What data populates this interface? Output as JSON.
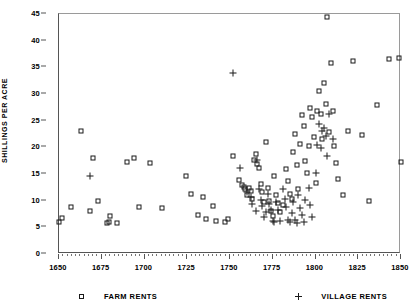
{
  "chart_data": {
    "type": "scatter",
    "title": "",
    "xlabel": "",
    "ylabel": "SHILLINGS PER ACRE",
    "xlim": [
      1650,
      1850
    ],
    "ylim": [
      0,
      45
    ],
    "xticks": [
      1650,
      1675,
      1700,
      1725,
      1750,
      1775,
      1800,
      1825,
      1850
    ],
    "yticks": [
      0,
      5,
      10,
      15,
      20,
      25,
      30,
      35,
      40,
      45
    ],
    "grid": false,
    "legend_position": "below-axes",
    "series": [
      {
        "name": "FARM RENTS",
        "marker": "square",
        "points": [
          [
            1650,
            6.0
          ],
          [
            1652,
            6.7
          ],
          [
            1657,
            8.8
          ],
          [
            1663,
            23.0
          ],
          [
            1668,
            8.1
          ],
          [
            1670,
            18.0
          ],
          [
            1673,
            9.9
          ],
          [
            1678,
            5.9
          ],
          [
            1679,
            6.0
          ],
          [
            1680,
            7.2
          ],
          [
            1684,
            5.8
          ],
          [
            1690,
            17.2
          ],
          [
            1694,
            18.0
          ],
          [
            1697,
            8.9
          ],
          [
            1703,
            17.0
          ],
          [
            1710,
            8.7
          ],
          [
            1724,
            14.6
          ],
          [
            1727,
            11.2
          ],
          [
            1731,
            7.3
          ],
          [
            1734,
            10.7
          ],
          [
            1736,
            6.5
          ],
          [
            1740,
            9.0
          ],
          [
            1742,
            6.2
          ],
          [
            1747,
            6.0
          ],
          [
            1749,
            6.6
          ],
          [
            1752,
            18.3
          ],
          [
            1755,
            13.8
          ],
          [
            1757,
            12.9
          ],
          [
            1758,
            12.6
          ],
          [
            1759,
            12.2
          ],
          [
            1760,
            11.1
          ],
          [
            1761,
            12.4
          ],
          [
            1762,
            11.8
          ],
          [
            1763,
            10.4
          ],
          [
            1764,
            17.7
          ],
          [
            1765,
            18.7
          ],
          [
            1766,
            16.9
          ],
          [
            1767,
            16.2
          ],
          [
            1768,
            13.2
          ],
          [
            1769,
            11.7
          ],
          [
            1770,
            9.8
          ],
          [
            1771,
            21.0
          ],
          [
            1772,
            12.3
          ],
          [
            1773,
            10.0
          ],
          [
            1774,
            8.0
          ],
          [
            1775,
            7.2
          ],
          [
            1776,
            14.6
          ],
          [
            1777,
            11.0
          ],
          [
            1778,
            9.6
          ],
          [
            1779,
            7.9
          ],
          [
            1781,
            9.1
          ],
          [
            1783,
            16.0
          ],
          [
            1784,
            13.6
          ],
          [
            1785,
            11.3
          ],
          [
            1786,
            10.3
          ],
          [
            1787,
            19.1
          ],
          [
            1788,
            22.5
          ],
          [
            1789,
            16.6
          ],
          [
            1790,
            12.1
          ],
          [
            1791,
            20.6
          ],
          [
            1792,
            26.1
          ],
          [
            1793,
            24.0
          ],
          [
            1794,
            17.4
          ],
          [
            1795,
            15.1
          ],
          [
            1796,
            20.2
          ],
          [
            1797,
            27.3
          ],
          [
            1798,
            25.6
          ],
          [
            1799,
            22.0
          ],
          [
            1800,
            13.3
          ],
          [
            1801,
            26.8
          ],
          [
            1802,
            30.5
          ],
          [
            1803,
            26.3
          ],
          [
            1804,
            21.5
          ],
          [
            1805,
            32.0
          ],
          [
            1806,
            28.2
          ],
          [
            1807,
            44.5
          ],
          [
            1808,
            22.8
          ],
          [
            1809,
            35.9
          ],
          [
            1810,
            26.9
          ],
          [
            1811,
            20.2
          ],
          [
            1812,
            17.1
          ],
          [
            1813,
            14.0
          ],
          [
            1816,
            11.1
          ],
          [
            1819,
            23.1
          ],
          [
            1822,
            36.2
          ],
          [
            1827,
            22.4
          ],
          [
            1831,
            9.9
          ],
          [
            1836,
            28.0
          ],
          [
            1843,
            36.6
          ],
          [
            1849,
            36.8
          ],
          [
            1850,
            17.3
          ]
        ]
      },
      {
        "name": "VILLAGE RENTS",
        "marker": "plus",
        "points": [
          [
            1668,
            14.7
          ],
          [
            1752,
            34.0
          ],
          [
            1756,
            16.1
          ],
          [
            1760,
            11.6
          ],
          [
            1762,
            10.6
          ],
          [
            1763,
            9.3
          ],
          [
            1765,
            8.1
          ],
          [
            1766,
            17.6
          ],
          [
            1767,
            12.2
          ],
          [
            1768,
            10.2
          ],
          [
            1769,
            9.0
          ],
          [
            1770,
            6.9
          ],
          [
            1771,
            7.8
          ],
          [
            1772,
            11.3
          ],
          [
            1773,
            9.4
          ],
          [
            1774,
            8.3
          ],
          [
            1775,
            6.2
          ],
          [
            1776,
            6.0
          ],
          [
            1777,
            9.8
          ],
          [
            1778,
            8.2
          ],
          [
            1779,
            6.2
          ],
          [
            1781,
            12.1
          ],
          [
            1782,
            10.3
          ],
          [
            1783,
            8.8
          ],
          [
            1784,
            6.4
          ],
          [
            1785,
            6.0
          ],
          [
            1786,
            7.7
          ],
          [
            1787,
            9.8
          ],
          [
            1788,
            6.3
          ],
          [
            1789,
            5.8
          ],
          [
            1790,
            11.0
          ],
          [
            1791,
            8.6
          ],
          [
            1792,
            7.4
          ],
          [
            1793,
            6.0
          ],
          [
            1794,
            10.1
          ],
          [
            1796,
            12.4
          ],
          [
            1797,
            9.1
          ],
          [
            1798,
            6.9
          ],
          [
            1800,
            15.2
          ],
          [
            1801,
            20.5
          ],
          [
            1802,
            24.3
          ],
          [
            1803,
            19.8
          ],
          [
            1804,
            23.0
          ],
          [
            1805,
            23.6
          ],
          [
            1806,
            22.2
          ],
          [
            1807,
            18.4
          ],
          [
            1808,
            26.3
          ],
          [
            1810,
            21.6
          ]
        ]
      }
    ]
  },
  "legend": {
    "farm": {
      "label": "FARM RENTS",
      "symbol": "square-marker"
    },
    "village": {
      "label": "VILLAGE RENTS",
      "symbol": "plus-marker"
    }
  }
}
